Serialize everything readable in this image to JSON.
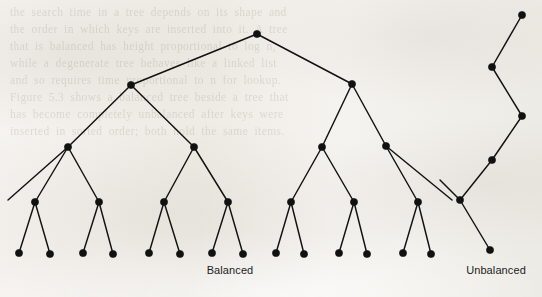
{
  "figure": {
    "width": 542,
    "height": 297,
    "background_color": "#f2efe9",
    "ink_color": "#111111",
    "caption_color": "#1c1c1c",
    "scan_background_text": [
      "the search time in a tree depends on its shape and",
      "the order in which keys are inserted into it. A tree",
      "that is balanced has height proportional to log n,",
      "while a degenerate tree behaves like a linked list",
      "and so requires time proportional to n for lookup.",
      "Figure 5.3 shows a balanced tree beside a tree that",
      "has become completely unbalanced after keys were",
      "inserted in sorted order; both hold the same items."
    ]
  },
  "chart_data": {
    "type": "diagram",
    "title": "",
    "subtitle": "",
    "node_radius": 3.6,
    "edge_width": 1.45,
    "trees": [
      {
        "name": "balanced",
        "label": "Balanced",
        "label_x": 230,
        "label_y": 264,
        "depth": 5,
        "node_count": 31,
        "leaf_count": 16,
        "nodes": [
          {
            "id": "r",
            "x": 257,
            "y": 34,
            "level": 0
          },
          {
            "id": "l1",
            "x": 131,
            "y": 85,
            "level": 1
          },
          {
            "id": "r1",
            "x": 352,
            "y": 84,
            "level": 1
          },
          {
            "id": "l1a",
            "x": 68,
            "y": 147,
            "level": 2
          },
          {
            "id": "l1b",
            "x": 194,
            "y": 147,
            "level": 2
          },
          {
            "id": "r1a",
            "x": 322,
            "y": 147,
            "level": 2
          },
          {
            "id": "r1b",
            "x": 386,
            "y": 146,
            "level": 2
          },
          {
            "id": "l1a-1",
            "x": 35,
            "y": 202,
            "level": 3
          },
          {
            "id": "l1a-2",
            "x": 99,
            "y": 202,
            "level": 3
          },
          {
            "id": "l1b-1",
            "x": 164,
            "y": 202,
            "level": 3
          },
          {
            "id": "l1b-2",
            "x": 228,
            "y": 202,
            "level": 3
          },
          {
            "id": "r1a-1",
            "x": 291,
            "y": 202,
            "level": 3
          },
          {
            "id": "r1a-2",
            "x": 354,
            "y": 202,
            "level": 3
          },
          {
            "id": "r1b-1",
            "x": 418,
            "y": 202,
            "level": 3
          },
          {
            "id": "leaf1",
            "x": 19,
            "y": 253,
            "level": 4
          },
          {
            "id": "leaf2",
            "x": 50,
            "y": 254,
            "level": 4
          },
          {
            "id": "leaf3",
            "x": 83,
            "y": 253,
            "level": 4
          },
          {
            "id": "leaf4",
            "x": 113,
            "y": 254,
            "level": 4
          },
          {
            "id": "leaf5",
            "x": 149,
            "y": 253,
            "level": 4
          },
          {
            "id": "leaf6",
            "x": 180,
            "y": 254,
            "level": 4
          },
          {
            "id": "leaf7",
            "x": 212,
            "y": 253,
            "level": 4
          },
          {
            "id": "leaf8",
            "x": 243,
            "y": 254,
            "level": 4
          },
          {
            "id": "leaf9",
            "x": 276,
            "y": 253,
            "level": 4
          },
          {
            "id": "leaf10",
            "x": 304,
            "y": 254,
            "level": 4
          },
          {
            "id": "leaf11",
            "x": 339,
            "y": 253,
            "level": 4
          },
          {
            "id": "leaf12",
            "x": 367,
            "y": 254,
            "level": 4
          },
          {
            "id": "leaf13",
            "x": 403,
            "y": 253,
            "level": 4
          },
          {
            "id": "leaf14",
            "x": 431,
            "y": 254,
            "level": 4
          }
        ],
        "edges": [
          [
            "r",
            "l1"
          ],
          [
            "r",
            "r1"
          ],
          [
            "l1",
            "l1a"
          ],
          [
            "l1",
            "l1b"
          ],
          [
            "r1",
            "r1a"
          ],
          [
            "r1",
            "r1b"
          ],
          [
            "l1a",
            "l1a-1"
          ],
          [
            "l1a",
            "l1a-2"
          ],
          [
            "l1b",
            "l1b-1"
          ],
          [
            "l1b",
            "l1b-2"
          ],
          [
            "r1a",
            "r1a-1"
          ],
          [
            "r1a",
            "r1a-2"
          ],
          [
            "r1b",
            "r1b-1"
          ],
          [
            "l1a-1",
            "leaf1"
          ],
          [
            "l1a-1",
            "leaf2"
          ],
          [
            "l1a-2",
            "leaf3"
          ],
          [
            "l1a-2",
            "leaf4"
          ],
          [
            "l1b-1",
            "leaf5"
          ],
          [
            "l1b-1",
            "leaf6"
          ],
          [
            "l1b-2",
            "leaf7"
          ],
          [
            "l1b-2",
            "leaf8"
          ],
          [
            "r1a-1",
            "leaf9"
          ],
          [
            "r1a-1",
            "leaf10"
          ],
          [
            "r1a-2",
            "leaf11"
          ],
          [
            "r1a-2",
            "leaf12"
          ],
          [
            "r1b-1",
            "leaf13"
          ],
          [
            "r1b-1",
            "leaf14"
          ]
        ],
        "partial_edges": [
          {
            "from": "l1a",
            "to_x": 8,
            "to_y": 200,
            "note": "left branch continues off toward page edge"
          },
          {
            "from": "r1b",
            "to_x": 452,
            "to_y": 200,
            "note": "right branch clipped by figure edge"
          }
        ]
      },
      {
        "name": "unbalanced",
        "label": "Unbalanced",
        "label_x": 496,
        "label_y": 264,
        "depth": 6,
        "node_count": 6,
        "leaf_count": 1,
        "nodes": [
          {
            "id": "u0",
            "x": 522,
            "y": 15,
            "level": 0
          },
          {
            "id": "u1",
            "x": 492,
            "y": 67,
            "level": 1
          },
          {
            "id": "u2",
            "x": 522,
            "y": 116,
            "level": 2
          },
          {
            "id": "u3",
            "x": 492,
            "y": 160,
            "level": 3
          },
          {
            "id": "u4",
            "x": 460,
            "y": 200,
            "level": 4
          },
          {
            "id": "u5",
            "x": 490,
            "y": 250,
            "level": 5
          }
        ],
        "edges": [
          [
            "u0",
            "u1"
          ],
          [
            "u1",
            "u2"
          ],
          [
            "u2",
            "u3"
          ],
          [
            "u3",
            "u4"
          ],
          [
            "u4",
            "u5"
          ]
        ],
        "partial_edges": [
          {
            "from": "u4",
            "to_x": 440,
            "to_y": 180,
            "note": "short stub toward the balanced tree"
          }
        ]
      }
    ]
  }
}
